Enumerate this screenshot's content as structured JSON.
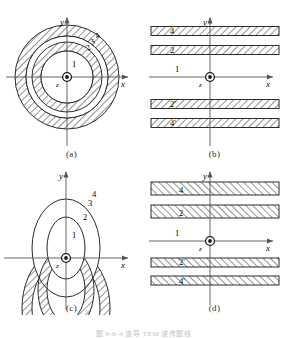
{
  "figure": {
    "caption": "图 9-6-4   波导 TEM 波传图线",
    "panels": [
      {
        "id": "a",
        "caption": "(a)",
        "type": "concentric-circles",
        "axis_x": "x",
        "axis_y": "y",
        "origin_symbol": "z",
        "hatch_direction": "forward",
        "regions": [
          {
            "label": "1",
            "kind": "core",
            "r_outer": 26
          },
          {
            "label": "2",
            "kind": "hatched-annulus",
            "r_inner": 26,
            "r_outer": 35
          },
          {
            "label": "3",
            "kind": "gap-annulus",
            "r_inner": 35,
            "r_outer": 41
          },
          {
            "label": "4",
            "kind": "hatched-annulus",
            "r_inner": 41,
            "r_outer": 52
          }
        ]
      },
      {
        "id": "b",
        "caption": "(b)",
        "type": "horizontal-slabs",
        "axis_x": "x",
        "axis_y": "y",
        "origin_symbol": "z",
        "hatch_direction": "forward",
        "axis_region_label": "1",
        "slabs": [
          {
            "label": "4",
            "y_center": -46,
            "thickness": 9
          },
          {
            "label": "2",
            "y_center": -27,
            "thickness": 9
          },
          {
            "label": "2'",
            "y_center": 27,
            "thickness": 9
          },
          {
            "label": "4'",
            "y_center": 46,
            "thickness": 9
          }
        ]
      },
      {
        "id": "c",
        "caption": "(c)",
        "type": "concentric-ellipses",
        "axis_x": "x",
        "axis_y": "y",
        "origin_symbol": "z",
        "hatch_direction": "forward",
        "regions": [
          {
            "label": "1",
            "kind": "core",
            "rx": 19,
            "ry": 31
          },
          {
            "label": "2",
            "kind": "hatched-annulus",
            "rx_inner": 19,
            "ry_inner": 31,
            "rx_outer": 28,
            "ry_outer": 42
          },
          {
            "label": "3",
            "kind": "gap-annulus",
            "rx_inner": 28,
            "ry_inner": 42,
            "rx_outer": 34,
            "ry_outer": 49
          },
          {
            "label": "4",
            "kind": "hatched-annulus",
            "rx_inner": 34,
            "ry_inner": 49,
            "rx_outer": 44,
            "ry_outer": 60
          }
        ]
      },
      {
        "id": "d",
        "caption": "(d)",
        "type": "horizontal-slabs",
        "axis_x": "x",
        "axis_y": "y",
        "origin_symbol": "z",
        "hatch_direction": "backward",
        "axis_region_label": "1",
        "slabs": [
          {
            "label": "4",
            "y_center": -51,
            "thickness": 13
          },
          {
            "label": "2",
            "y_center": -28,
            "thickness": 13
          },
          {
            "label": "2'",
            "y_center": 29,
            "thickness": 9
          },
          {
            "label": "4'",
            "y_center": 47,
            "thickness": 9
          }
        ]
      }
    ]
  },
  "style": {
    "stroke": "#2b2b2b",
    "hatch": "#3a3a3a",
    "axis": "#555555",
    "background": "#ffffff"
  }
}
